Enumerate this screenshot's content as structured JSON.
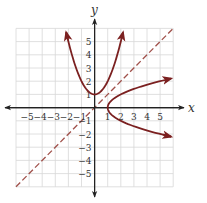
{
  "chart_data": {
    "type": "line",
    "title": "",
    "xlabel": "x",
    "ylabel": "y",
    "xlim": [
      -6,
      6
    ],
    "ylim": [
      -6,
      6
    ],
    "grid": true,
    "x_ticks": [
      -5,
      -4,
      -3,
      -2,
      -1,
      1,
      2,
      3,
      4,
      5
    ],
    "y_ticks": [
      -5,
      -4,
      -3,
      -2,
      -1,
      1,
      2,
      3,
      4,
      5
    ],
    "x_tick_labels": [
      "−5",
      "−4",
      "−3",
      "−2",
      "−1",
      "1",
      "2",
      "3",
      "4",
      "5"
    ],
    "y_tick_labels": [
      "−5",
      "−4",
      "−3",
      "−2",
      "−1",
      "1",
      "2",
      "3",
      "4",
      "5"
    ],
    "series": [
      {
        "name": "f(x) = x^2 + 1",
        "style": "solid",
        "color": "#7b2020",
        "x": [
          -2.17,
          -2,
          -1.5,
          -1,
          -0.5,
          0,
          0.5,
          1,
          1.5,
          2,
          2.17
        ],
        "y": [
          5.7,
          5,
          3.25,
          2,
          1.25,
          1,
          1.25,
          2,
          3.25,
          5,
          5.7
        ],
        "arrows": "both"
      },
      {
        "name": "inverse: x = y^2 + 1",
        "style": "solid",
        "color": "#7b2020",
        "x": [
          5.84,
          5,
          3.25,
          2,
          1.25,
          1,
          1.25,
          2,
          3.25,
          5,
          5.84
        ],
        "y": [
          -2.2,
          -2,
          -1.5,
          -1,
          -0.5,
          0,
          0.5,
          1,
          1.5,
          2,
          2.2
        ],
        "arrows": "both"
      },
      {
        "name": "y = x",
        "style": "dashed",
        "color": "#a0504a",
        "x": [
          -6,
          6
        ],
        "y": [
          -6,
          6
        ],
        "arrows": "none"
      }
    ]
  },
  "labels": {
    "x_axis": "x",
    "y_axis": "y"
  },
  "colors": {
    "curve": "#7b2020",
    "dashed_line": "#a0504a",
    "grid": "#d8d8d8",
    "axis": "#222222"
  }
}
